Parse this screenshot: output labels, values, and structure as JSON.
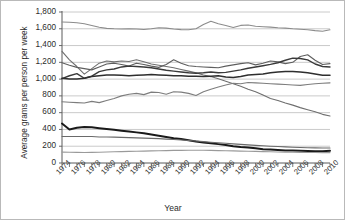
{
  "chart_data": {
    "type": "line",
    "title": "",
    "xlabel": "Year",
    "ylabel": "Average grams per person per week",
    "xlim": [
      1974,
      2010
    ],
    "ylim": [
      0,
      1800
    ],
    "ytick_values": [
      0,
      200,
      400,
      600,
      800,
      1000,
      1200,
      1400,
      1600,
      1800
    ],
    "ytick_labels": [
      "0",
      "200",
      "400",
      "600",
      "800",
      "1,000",
      "1,200",
      "1,400",
      "1,600",
      "1,800"
    ],
    "xtick_values": [
      1974,
      1976,
      1978,
      1980,
      1982,
      1984,
      1986,
      1988,
      1990,
      1992,
      1994,
      1996,
      1998,
      2000,
      2002,
      2004,
      2006,
      2008,
      2010
    ],
    "xtick_labels": [
      "1974",
      "1976",
      "1978",
      "1980",
      "1982",
      "1984",
      "1986",
      "1988",
      "1990",
      "1992",
      "1994",
      "1996",
      "1998",
      "2000",
      "2002",
      "2004",
      "2006",
      "2008",
      "2010"
    ],
    "grid": true,
    "grid_axis": "y",
    "legend": "none",
    "x": [
      1974,
      1975,
      1976,
      1977,
      1978,
      1979,
      1980,
      1981,
      1982,
      1983,
      1984,
      1985,
      1986,
      1987,
      1988,
      1989,
      1990,
      1991,
      1992,
      1993,
      1994,
      1995,
      1996,
      1997,
      1998,
      1999,
      2000,
      2001,
      2002,
      2003,
      2004,
      2005,
      2006,
      2007,
      2008,
      2009,
      2010
    ],
    "series": [
      {
        "name": "series-1-top",
        "color": "#8c8c8c",
        "width": 1.1,
        "values": [
          1680,
          1678,
          1672,
          1660,
          1640,
          1618,
          1605,
          1600,
          1598,
          1600,
          1597,
          1592,
          1600,
          1612,
          1608,
          1598,
          1590,
          1588,
          1600,
          1650,
          1690,
          1660,
          1640,
          1615,
          1640,
          1645,
          1630,
          1625,
          1620,
          1612,
          1608,
          1600,
          1595,
          1588,
          1578,
          1570,
          1588
        ]
      },
      {
        "name": "series-2-upper-declining",
        "color": "#6f6f6f",
        "width": 1.1,
        "values": [
          1330,
          1230,
          1150,
          1060,
          1125,
          1190,
          1215,
          1205,
          1215,
          1210,
          1230,
          1208,
          1180,
          1165,
          1150,
          1135,
          1115,
          1095,
          1075,
          1050,
          1030,
          1005,
          975,
          945,
          915,
          880,
          850,
          810,
          770,
          745,
          715,
          690,
          660,
          635,
          610,
          580,
          560
        ]
      },
      {
        "name": "series-3-mid-peak",
        "color": "#5e5e5e",
        "width": 1.1,
        "values": [
          1195,
          1165,
          1140,
          1125,
          1110,
          1145,
          1180,
          1190,
          1175,
          1155,
          1190,
          1175,
          1155,
          1140,
          1175,
          1230,
          1190,
          1160,
          1150,
          1145,
          1140,
          1135,
          1155,
          1170,
          1185,
          1195,
          1170,
          1190,
          1215,
          1205,
          1185,
          1200,
          1270,
          1290,
          1225,
          1175,
          1185
        ]
      },
      {
        "name": "series-4-mid-rising",
        "color": "#3a3a3a",
        "width": 1.4,
        "values": [
          1005,
          1040,
          1065,
          1010,
          1035,
          1090,
          1110,
          1120,
          1145,
          1155,
          1150,
          1145,
          1135,
          1120,
          1105,
          1095,
          1085,
          1075,
          1070,
          1075,
          1085,
          1075,
          1080,
          1095,
          1110,
          1130,
          1145,
          1160,
          1175,
          1195,
          1225,
          1250,
          1245,
          1230,
          1180,
          1150,
          1145
        ]
      },
      {
        "name": "series-5-mid-flat",
        "color": "#2e2e2e",
        "width": 1.5,
        "values": [
          1010,
          1000,
          1000,
          1010,
          1030,
          1040,
          1050,
          1050,
          1045,
          1040,
          1045,
          1050,
          1055,
          1050,
          1045,
          1040,
          1040,
          1035,
          1035,
          1030,
          1035,
          1040,
          1025,
          1020,
          1030,
          1050,
          1055,
          1060,
          1075,
          1085,
          1090,
          1090,
          1085,
          1075,
          1060,
          1045,
          1045
        ]
      },
      {
        "name": "series-6-lower-rising",
        "color": "#7d7d7d",
        "width": 1.1,
        "values": [
          730,
          725,
          720,
          715,
          735,
          720,
          745,
          770,
          800,
          820,
          830,
          815,
          845,
          840,
          820,
          850,
          845,
          830,
          805,
          850,
          880,
          905,
          930,
          950,
          945,
          960,
          955,
          950,
          945,
          940,
          935,
          930,
          925,
          935,
          945,
          950,
          955
        ]
      },
      {
        "name": "series-7-bottom-declining",
        "color": "#1a1a1a",
        "width": 2.0,
        "values": [
          470,
          400,
          420,
          430,
          425,
          415,
          405,
          395,
          385,
          375,
          365,
          355,
          340,
          325,
          310,
          295,
          285,
          270,
          255,
          245,
          235,
          225,
          215,
          200,
          190,
          185,
          175,
          165,
          160,
          155,
          150,
          148,
          145,
          143,
          140,
          140,
          145
        ]
      },
      {
        "name": "series-8-bottom-flat",
        "color": "#6a6a6a",
        "width": 1.1,
        "values": [
          315,
          315,
          315,
          315,
          315,
          310,
          310,
          308,
          305,
          302,
          300,
          297,
          294,
          290,
          285,
          280,
          275,
          268,
          262,
          255,
          248,
          242,
          235,
          228,
          222,
          216,
          210,
          205,
          200,
          196,
          192,
          188,
          185,
          182,
          180,
          178,
          178
        ]
      },
      {
        "name": "series-9-bottom-lowest",
        "color": "#9a9a9a",
        "width": 1.1,
        "values": [
          130,
          128,
          127,
          126,
          127,
          129,
          132,
          134,
          136,
          138,
          140,
          142,
          144,
          146,
          148,
          150,
          151,
          152,
          152,
          152,
          150,
          148,
          146,
          144,
          142,
          140,
          138,
          136,
          134,
          132,
          130,
          128,
          127,
          126,
          125,
          124,
          124
        ]
      }
    ]
  }
}
